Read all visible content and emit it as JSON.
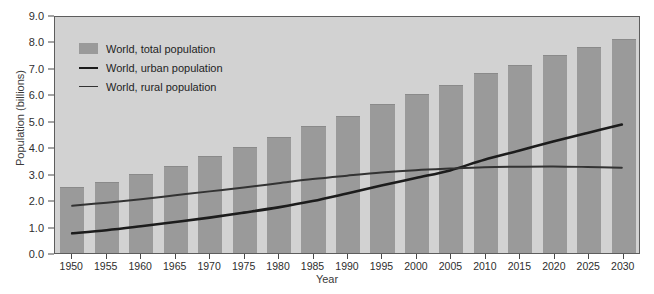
{
  "chart_data": {
    "type": "bar",
    "title": "",
    "xlabel": "Year",
    "ylabel": "Population (billions)",
    "categories": [
      1950,
      1955,
      1960,
      1965,
      1970,
      1975,
      1980,
      1985,
      1990,
      1995,
      2000,
      2005,
      2010,
      2015,
      2020,
      2025,
      2030
    ],
    "xlim": [
      1947.5,
      2032.5
    ],
    "ylim": [
      0.0,
      9.0
    ],
    "yticks": [
      "0.0",
      "1.0",
      "2.0",
      "3.0",
      "4.0",
      "5.0",
      "6.0",
      "7.0",
      "8.0",
      "9.0"
    ],
    "grid": false,
    "legend_position": "upper-left",
    "series": [
      {
        "name": "World, total population",
        "type": "bar",
        "color": "#9a9a9a",
        "values": [
          2.5,
          2.7,
          3.0,
          3.3,
          3.65,
          4.0,
          4.4,
          4.8,
          5.2,
          5.65,
          6.0,
          6.35,
          6.8,
          7.1,
          7.5,
          7.8,
          8.1
        ]
      },
      {
        "name": "World, urban population",
        "type": "line",
        "color": "#1c1c1c",
        "values": [
          0.75,
          0.87,
          1.02,
          1.18,
          1.35,
          1.54,
          1.74,
          1.98,
          2.27,
          2.57,
          2.86,
          3.15,
          3.56,
          3.9,
          4.25,
          4.58,
          4.9
        ]
      },
      {
        "name": "World, rural population",
        "type": "line",
        "color": "#333333",
        "values": [
          1.8,
          1.92,
          2.05,
          2.2,
          2.35,
          2.5,
          2.66,
          2.82,
          2.95,
          3.07,
          3.16,
          3.22,
          3.27,
          3.29,
          3.3,
          3.28,
          3.25
        ]
      }
    ]
  },
  "legend": {
    "items": [
      {
        "label": "World, total population",
        "marker": "swatch"
      },
      {
        "label": "World, urban population",
        "marker": "line"
      },
      {
        "label": "World, rural population",
        "marker": "line-thin"
      }
    ]
  }
}
